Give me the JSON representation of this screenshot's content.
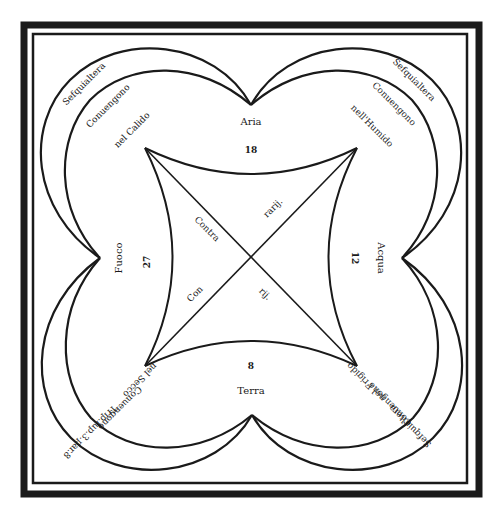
{
  "diagram": {
    "type": "elemental-proportions-diagram",
    "colors": {
      "ink": "#1a1a1a",
      "paper": "#ffffff"
    },
    "elements": {
      "top": {
        "name": "Aria",
        "number": "18"
      },
      "right": {
        "name": "Acqua",
        "number": "12"
      },
      "bottom": {
        "name": "Terra",
        "number": "8"
      },
      "left": {
        "name": "Fuoco",
        "number": "27"
      }
    },
    "lobes": {
      "top_left": {
        "ratio": "Sefquialtera",
        "relation": "Conuengono",
        "quality": "nel Calido"
      },
      "top_right": {
        "ratio": "Sefquialtera",
        "relation": "Conuengono",
        "quality": "nell'Humido"
      },
      "bottom_right": {
        "ratio": "Sefquialtera",
        "relation": "Conuengono",
        "quality": "nel Frigido"
      },
      "bottom_left": {
        "ratio": "Trip.ſup.3.par.8",
        "relation": "Conuengono",
        "quality": "nel Secco"
      }
    },
    "center": {
      "diag_1_a": "Contra",
      "diag_1_b": "rarij.",
      "diag_2_a": "Con",
      "diag_2_b": "rij."
    }
  }
}
